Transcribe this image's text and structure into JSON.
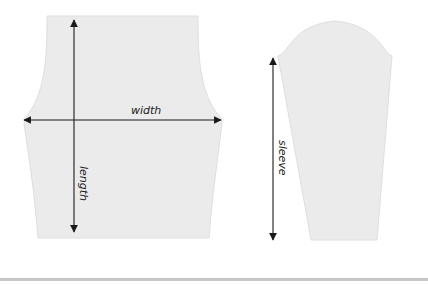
{
  "diagram": {
    "body_piece": {
      "labels": {
        "width": "width",
        "length": "length"
      }
    },
    "sleeve_piece": {
      "labels": {
        "sleeve": "sleeve"
      }
    },
    "colors": {
      "fabric": "#ebebeb",
      "fabric_edge": "#dcdcdc",
      "arrow": "#1a1a1a",
      "rule": "#c8c8c8"
    }
  }
}
